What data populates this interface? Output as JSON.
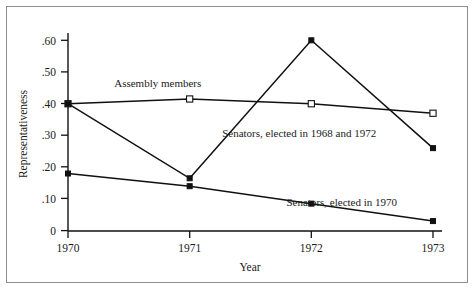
{
  "chart_data": {
    "type": "line",
    "title": "",
    "xlabel": "Year",
    "ylabel": "Representativeness",
    "x": [
      1970,
      1971,
      1972,
      1973
    ],
    "xtick_labels": [
      "1970",
      "1971",
      "1972",
      "1973"
    ],
    "ytick_labels": [
      "0",
      ".10",
      ".20",
      ".30",
      ".40",
      ".50",
      ".60"
    ],
    "ytick_values": [
      0,
      0.1,
      0.2,
      0.3,
      0.4,
      0.5,
      0.6
    ],
    "ylim": [
      0,
      0.645
    ],
    "xlim": [
      1969.72,
      1973.22
    ],
    "grid": false,
    "legend_position": "inline-annotations",
    "series": [
      {
        "name": "Assembly members",
        "marker": "open-square",
        "values": [
          0.4,
          0.415,
          0.4,
          0.37
        ]
      },
      {
        "name": "Senators, elected in 1968 and 1972",
        "marker": "filled-square",
        "values": [
          0.4,
          0.165,
          0.6,
          0.26
        ]
      },
      {
        "name": "Senators, elected in 1970",
        "marker": "filled-square",
        "values": [
          0.18,
          0.14,
          0.085,
          0.03
        ]
      }
    ],
    "annotations": [
      {
        "text": "Assembly members",
        "x": 1970.38,
        "y": 0.452,
        "anchor": "start"
      },
      {
        "text": "Senators, elected in 1968 and 1972",
        "x": 1971.9,
        "y": 0.295,
        "anchor": "middle"
      },
      {
        "text": "Senators, elected in 1970",
        "x": 1972.25,
        "y": 0.078,
        "anchor": "middle"
      }
    ],
    "colors": {
      "line": "#111111",
      "marker_fill_open": "#ffffff",
      "marker_fill_solid": "#111111",
      "axis": "#111111",
      "frame": "#8e8e8e",
      "background": "#ffffff"
    }
  }
}
